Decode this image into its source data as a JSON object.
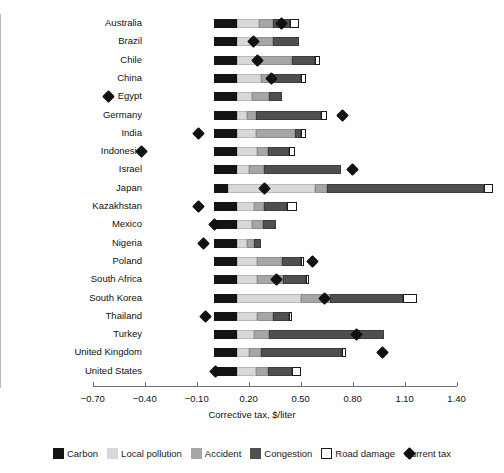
{
  "chart_data": {
    "type": "bar",
    "orientation": "horizontal",
    "stacked": true,
    "title": "",
    "xlabel": "Corrective tax, $/liter",
    "ylabel": "",
    "xlim": [
      -0.85,
      1.55
    ],
    "xticks": [
      -0.7,
      -0.4,
      -0.1,
      0.2,
      0.5,
      0.8,
      1.1,
      1.4
    ],
    "xticklabels": [
      "−0.70",
      "−0.40",
      "−0.10",
      "0.20",
      "0.50",
      "0.80",
      "1.10",
      "1.40"
    ],
    "grid": false,
    "legend_position": "bottom",
    "zero_line": 0,
    "categories": [
      "Australia",
      "Brazil",
      "Chile",
      "China",
      "Egypt",
      "Germany",
      "India",
      "Indonesia",
      "Israel",
      "Japan",
      "Kazakhstan",
      "Mexico",
      "Nigeria",
      "Poland",
      "South Africa",
      "South Korea",
      "Thailand",
      "Turkey",
      "United Kingdom",
      "United States"
    ],
    "series": [
      {
        "name": "Carbon",
        "color": "#141414",
        "values": [
          0.13,
          0.13,
          0.13,
          0.13,
          0.13,
          0.13,
          0.13,
          0.13,
          0.13,
          0.08,
          0.13,
          0.13,
          0.13,
          0.13,
          0.13,
          0.13,
          0.13,
          0.13,
          0.13,
          0.13
        ]
      },
      {
        "name": "Local pollution",
        "color": "#d8d8d8",
        "values": [
          0.13,
          0.12,
          0.11,
          0.14,
          0.09,
          0.06,
          0.11,
          0.12,
          0.07,
          0.5,
          0.1,
          0.09,
          0.06,
          0.12,
          0.12,
          0.37,
          0.12,
          0.1,
          0.07,
          0.11
        ]
      },
      {
        "name": "Accident",
        "color": "#a6a6a6",
        "values": [
          0.08,
          0.09,
          0.21,
          0.07,
          0.1,
          0.05,
          0.23,
          0.06,
          0.09,
          0.07,
          0.06,
          0.06,
          0.04,
          0.14,
          0.15,
          0.17,
          0.09,
          0.09,
          0.07,
          0.07
        ]
      },
      {
        "name": "Congestion",
        "color": "#4f4f4f",
        "values": [
          0.1,
          0.15,
          0.13,
          0.16,
          0.07,
          0.38,
          0.03,
          0.12,
          0.44,
          0.91,
          0.13,
          0.08,
          0.04,
          0.11,
          0.13,
          0.42,
          0.09,
          0.66,
          0.47,
          0.14
        ]
      },
      {
        "name": "Road damage",
        "color": "#ffffff",
        "values": [
          0.05,
          0.0,
          0.03,
          0.03,
          0.0,
          0.03,
          0.03,
          0.04,
          0.0,
          0.05,
          0.06,
          0.0,
          0.0,
          0.02,
          0.02,
          0.08,
          0.02,
          0.0,
          0.02,
          0.05
        ]
      }
    ],
    "marker_series": {
      "name": "Current tax",
      "marker": "diamond",
      "color": "#111111",
      "values": [
        0.39,
        0.23,
        0.25,
        0.33,
        -0.61,
        0.74,
        -0.09,
        -0.42,
        0.8,
        0.29,
        -0.09,
        0.0,
        -0.06,
        0.57,
        0.36,
        0.64,
        -0.05,
        0.82,
        0.97,
        0.01
      ]
    }
  },
  "axis": {
    "xlabel": "Corrective tax, $/liter",
    "ticklabels": [
      "−0.70",
      "−0.40",
      "−0.10",
      "0.20",
      "0.50",
      "0.80",
      "1.10",
      "1.40"
    ]
  },
  "legend": {
    "items": [
      {
        "label": "Carbon",
        "swatch": "carbon",
        "icon": "square-swatch-icon"
      },
      {
        "label": "Local pollution",
        "swatch": "localpol",
        "icon": "square-swatch-icon"
      },
      {
        "label": "Accident",
        "swatch": "accident",
        "icon": "square-swatch-icon"
      },
      {
        "label": "Congestion",
        "swatch": "congestion",
        "icon": "square-swatch-icon"
      },
      {
        "label": "Road damage",
        "swatch": "roaddamage",
        "icon": "square-swatch-icon"
      },
      {
        "label": "Current tax",
        "swatch": "diamond",
        "icon": "diamond-marker-icon"
      }
    ]
  }
}
